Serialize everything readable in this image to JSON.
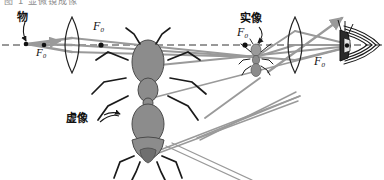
{
  "figure": {
    "kind": "optics-ray-diagram",
    "caption_top_cropped": "图 1 显微镜成像",
    "width": 384,
    "height": 180,
    "background": "#ffffff",
    "optical_axis": {
      "y": 45,
      "style": "dashed",
      "color": "#333333"
    }
  },
  "labels": {
    "object": "物",
    "focal_left": "F₀",
    "focal_mid": "F₀",
    "focal_right": "F₀",
    "real_image": "实像",
    "virtual_image": "虚像"
  },
  "colors": {
    "ray": "#9a9a9a",
    "outline": "#1a1a1a",
    "axis": "#333333",
    "ant_fill": "#8c8c8c",
    "ant_fill_dark": "#6f6f6f",
    "lens_stroke": "#222222"
  },
  "elements": {
    "objective_lens": {
      "cx": 72,
      "cy": 45,
      "rx": 10,
      "ry": 28
    },
    "eyepiece_lens": {
      "cx": 295,
      "cy": 45,
      "rx": 10,
      "ry": 28
    },
    "object_point": {
      "x": 26,
      "y": 44
    },
    "focal_left_point": {
      "x": 44,
      "y": 45
    },
    "focal_mid_point": {
      "x": 101,
      "y": 45
    },
    "focal_right_point": {
      "x": 245,
      "y": 45
    },
    "eye": {
      "x": 352,
      "y": 45
    },
    "real_image_ant": {
      "x": 255,
      "y": 56
    },
    "virtual_image_ant": {
      "x": 148,
      "y": 108
    }
  }
}
